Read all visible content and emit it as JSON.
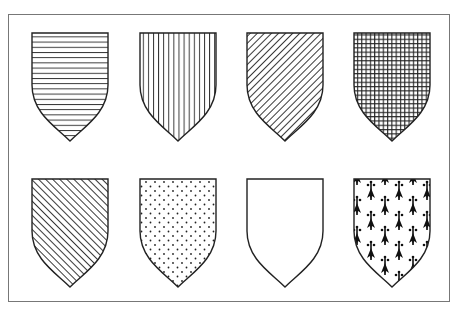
{
  "figure": {
    "shields": [
      {
        "name": "shield-horizontal-lines",
        "pattern": "horizontal",
        "tincture_hint": "horizontal hatching"
      },
      {
        "name": "shield-vertical-lines",
        "pattern": "vertical",
        "tincture_hint": "vertical hatching"
      },
      {
        "name": "shield-diagonal-dexter",
        "pattern": "diag-down",
        "tincture_hint": "diagonal hatching (dexter)"
      },
      {
        "name": "shield-crosshatch",
        "pattern": "grid",
        "tincture_hint": "cross hatching"
      },
      {
        "name": "shield-diagonal-sinister",
        "pattern": "diag-up",
        "tincture_hint": "diagonal hatching (sinister)"
      },
      {
        "name": "shield-dotted",
        "pattern": "dots",
        "tincture_hint": "dotted"
      },
      {
        "name": "shield-plain",
        "pattern": "plain",
        "tincture_hint": "plain"
      },
      {
        "name": "shield-ermine",
        "pattern": "ermine",
        "tincture_hint": "ermine"
      }
    ],
    "colors": {
      "stroke": "#222222",
      "frame": "#777777",
      "background": "#ffffff"
    }
  }
}
